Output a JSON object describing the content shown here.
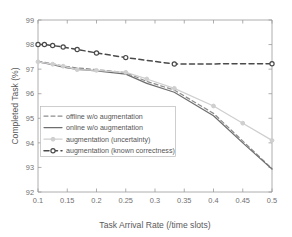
{
  "chart_data": {
    "type": "line",
    "title": "",
    "xlabel": "Task Arrival Rate (/time slots)",
    "ylabel": "Completed Task (%)",
    "xlim": [
      0.1,
      0.5
    ],
    "ylim": [
      92,
      99
    ],
    "xticks": [
      "0.1",
      "0.15",
      "0.2",
      "0.25",
      "0.3",
      "0.35",
      "0.4",
      "0.45",
      "0.5"
    ],
    "xtick_values": [
      0.1,
      0.15,
      0.2,
      0.25,
      0.3,
      0.35,
      0.4,
      0.45,
      0.5
    ],
    "yticks": [
      "92",
      "93",
      "94",
      "95",
      "96",
      "97",
      "98",
      "99"
    ],
    "ytick_values": [
      92,
      93,
      94,
      95,
      96,
      97,
      98,
      99
    ],
    "grid": false,
    "legend_position": "center-left",
    "series": [
      {
        "name": "offline w/o augmentation",
        "color": "#8d8d8d",
        "style": "dashed",
        "marker": "none",
        "x": [
          0.1,
          0.125,
          0.143,
          0.167,
          0.2,
          0.25,
          0.286,
          0.333,
          0.4,
          0.5
        ],
        "y": [
          97.32,
          97.22,
          97.13,
          97.05,
          96.98,
          96.86,
          96.5,
          96.15,
          95.2,
          92.95
        ]
      },
      {
        "name": "online w/o augmentation",
        "color": "#6e6e6e",
        "style": "solid",
        "marker": "none",
        "x": [
          0.1,
          0.125,
          0.143,
          0.167,
          0.2,
          0.25,
          0.286,
          0.333,
          0.4,
          0.45,
          0.5
        ],
        "y": [
          97.3,
          97.18,
          97.08,
          96.99,
          96.93,
          96.8,
          96.42,
          96.06,
          95.1,
          94.0,
          92.93
        ]
      },
      {
        "name": "augmentation (uncertainty)",
        "color": "#cfcfcf",
        "style": "solid",
        "marker": "circle",
        "x": [
          0.1,
          0.125,
          0.143,
          0.167,
          0.2,
          0.25,
          0.286,
          0.333,
          0.4,
          0.45,
          0.5
        ],
        "y": [
          97.3,
          97.2,
          97.12,
          96.98,
          96.95,
          96.87,
          96.6,
          96.22,
          95.5,
          94.8,
          94.1
        ]
      },
      {
        "name": "augmentation (known correctness)",
        "color": "#4a4a4a",
        "style": "dashed",
        "marker": "circle",
        "x": [
          0.1,
          0.111,
          0.125,
          0.143,
          0.167,
          0.2,
          0.25,
          0.333,
          0.5
        ],
        "y": [
          98.0,
          98.0,
          97.96,
          97.9,
          97.8,
          97.66,
          97.47,
          97.21,
          97.22
        ]
      }
    ]
  },
  "legend": {
    "entries": [
      {
        "label": "offline w/o augmentation"
      },
      {
        "label": "online w/o augmentation"
      },
      {
        "label": "augmentation (uncertainty)"
      },
      {
        "label": "augmentation (known correctness)"
      }
    ]
  }
}
